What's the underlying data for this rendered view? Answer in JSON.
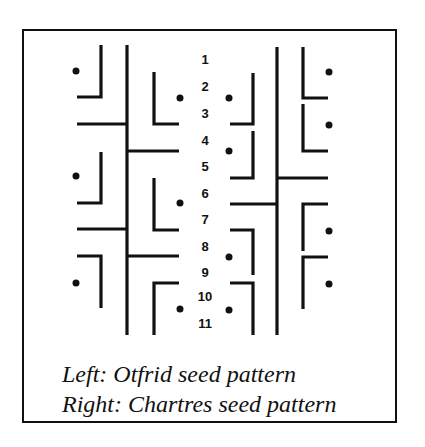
{
  "figure": {
    "caption_line1": "Left: Otfrid seed pattern",
    "caption_line2": "Right: Chartres seed pattern",
    "row_numbers": [
      "1",
      "2",
      "3",
      "4",
      "5",
      "6",
      "7",
      "8",
      "9",
      "10",
      "11"
    ],
    "colors": {
      "ink": "#111111",
      "background": "#ffffff"
    }
  }
}
